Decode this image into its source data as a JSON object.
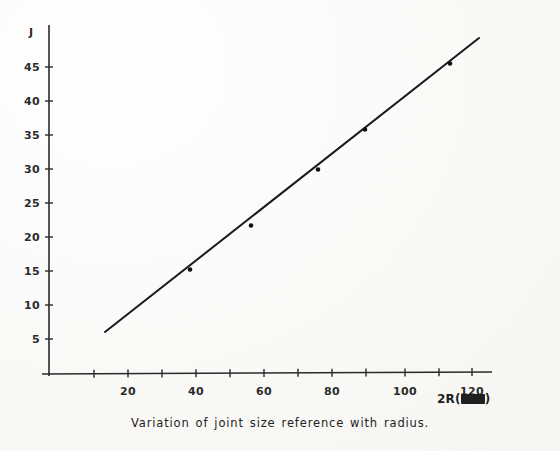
{
  "figure": {
    "caption": "Variation of joint size reference with radius.",
    "caption_x": 0,
    "caption_y": 416,
    "background_color": "#fbfbf9",
    "ink_color": "#1f1f1f"
  },
  "axes": {
    "y_axis_title": "J",
    "y_axis_title_x": 29,
    "y_axis_title_y": 26,
    "x_axis_title_text": "2R(",
    "x_axis_title_unit": "mm",
    "x_axis_title_close": ")",
    "x_axis_title_x": 437,
    "x_axis_title_y": 392,
    "origin_px": {
      "x": 49,
      "y": 374
    },
    "x_value_at_origin_px": 60,
    "px_per_x_unit": 3.42,
    "px_per_y_unit": 6.8,
    "y_axis_top_px": 25,
    "x_axis_right_px": 492
  },
  "y_ticks": [
    {
      "value": 45,
      "label": "45",
      "y": 67
    },
    {
      "value": 40,
      "label": "40",
      "y": 101
    },
    {
      "value": 35,
      "label": "35",
      "y": 135
    },
    {
      "value": 30,
      "label": "30",
      "y": 169
    },
    {
      "value": 25,
      "label": "25",
      "y": 203
    },
    {
      "value": 20,
      "label": "20",
      "y": 237
    },
    {
      "value": 15,
      "label": "15",
      "y": 271
    },
    {
      "value": 10,
      "label": "10",
      "y": 305
    },
    {
      "value": 5,
      "label": "5",
      "y": 339
    }
  ],
  "x_ticks": [
    {
      "value": 10,
      "label": "",
      "x": 94
    },
    {
      "value": 20,
      "label": "20",
      "x": 128
    },
    {
      "value": 30,
      "label": "",
      "x": 162
    },
    {
      "value": 40,
      "label": "40",
      "x": 196
    },
    {
      "value": 50,
      "label": "",
      "x": 230
    },
    {
      "value": 60,
      "label": "60",
      "x": 264
    },
    {
      "value": 70,
      "label": "",
      "x": 298
    },
    {
      "value": 80,
      "label": "80",
      "x": 332
    },
    {
      "value": 90,
      "label": "",
      "x": 366
    },
    {
      "value": 100,
      "label": "100",
      "x": 405
    },
    {
      "value": 110,
      "label": "",
      "x": 439
    },
    {
      "value": 120,
      "label": "120",
      "x": 472
    }
  ],
  "chart_data": {
    "type": "line",
    "title": "Variation of joint size reference with radius.",
    "xlabel": "2R(mm)",
    "ylabel": "J",
    "xlim": [
      0,
      130
    ],
    "ylim": [
      0,
      50
    ],
    "grid": false,
    "legend": "none",
    "series": [
      {
        "name": "Joint size reference vs radius",
        "kind": "fit-line",
        "x": [
          13,
          123
        ],
        "y": [
          6,
          49
        ]
      },
      {
        "name": "measured points",
        "kind": "scatter",
        "marker": "dot",
        "x": [
          60,
          76,
          88,
          112
        ],
        "y": [
          24.2,
          30.7,
          35.4,
          45.6
        ]
      }
    ],
    "line_endpoints_px": [
      {
        "x": 105,
        "y": 332
      },
      {
        "x": 479,
        "y": 38
      }
    ],
    "marker_points_px": [
      {
        "x": 190,
        "y": 268
      },
      {
        "x": 251,
        "y": 224
      },
      {
        "x": 318,
        "y": 168
      },
      {
        "x": 365,
        "y": 128
      },
      {
        "x": 450,
        "y": 62
      }
    ]
  }
}
